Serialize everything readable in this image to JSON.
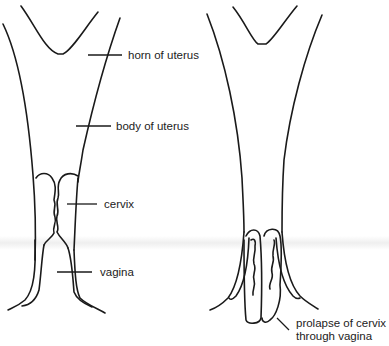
{
  "figure": {
    "left_diagram": {
      "title": "normal uterus",
      "labels": {
        "horn": "horn of uterus",
        "body": "body of uterus",
        "cervix": "cervix",
        "vagina": "vagina"
      }
    },
    "right_diagram": {
      "labels": {
        "prolapse_line1": "prolapse of cervix",
        "prolapse_line2": "through vagina"
      }
    }
  }
}
